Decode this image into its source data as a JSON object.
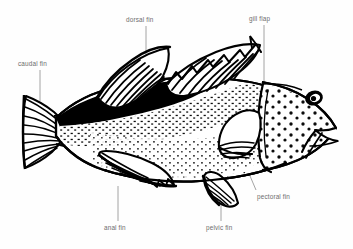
{
  "diagram": {
    "style": "black-and-white line drawing with stipple shading",
    "background_color": "#fefefe",
    "ink_color": "#000000",
    "leader_line_color": "#9a9a9a",
    "label_text_color": "#6d6d6d"
  },
  "labels": {
    "caudal_fin": "caudal fin",
    "dorsal_fin": "dorsal fin",
    "gill_flap": "gill flap",
    "pectoral_fin": "pectoral fin",
    "pelvic_fin": "pelvic fin",
    "anal_fin": "anal fin"
  },
  "callouts": [
    {
      "id": "caudal-fin",
      "label": "caudal fin",
      "label_x": 18,
      "label_y": 60,
      "leader_from_x": 40,
      "leader_from_y": 70,
      "leader_to_x": 40,
      "leader_to_y": 100
    },
    {
      "id": "dorsal-fin",
      "label": "dorsal fin",
      "label_x": 126,
      "label_y": 16,
      "leader_from_x": 146,
      "leader_from_y": 26,
      "leader_to_x": 146,
      "leader_to_y": 61
    },
    {
      "id": "gill-flap",
      "label": "gill flap",
      "label_x": 249,
      "label_y": 15,
      "leader_from_x": 264,
      "leader_from_y": 25,
      "leader_to_x": 264,
      "leader_to_y": 100
    },
    {
      "id": "pectoral-fin",
      "label": "pectoral fin",
      "label_x": 257,
      "label_y": 193,
      "leader_from_x": 256,
      "leader_from_y": 190,
      "leader_to_x": 232,
      "leader_to_y": 135
    },
    {
      "id": "pelvic-fin",
      "label": "pelvic fin",
      "label_x": 206,
      "label_y": 224,
      "leader_from_x": 221,
      "leader_from_y": 221,
      "leader_to_x": 221,
      "leader_to_y": 190
    },
    {
      "id": "anal-fin",
      "label": "anal fin",
      "label_x": 104,
      "label_y": 224,
      "leader_from_x": 118,
      "leader_from_y": 221,
      "leader_to_x": 118,
      "leader_to_y": 185
    }
  ],
  "parts": [
    {
      "id": "caudal-fin",
      "name": "caudal fin",
      "description": "fan-shaped tail fin with radiating ray lines"
    },
    {
      "id": "dorsal-fin",
      "name": "dorsal fin",
      "description": "long fin along the back, spiny front portion and soft-rayed rear portion"
    },
    {
      "id": "gill-flap",
      "name": "gill flap",
      "description": "operculum covering the gills behind the head"
    },
    {
      "id": "pectoral-fin",
      "name": "pectoral fin",
      "description": "rounded fan-shaped fin behind the gill flap"
    },
    {
      "id": "pelvic-fin",
      "name": "pelvic fin",
      "description": "paired fin on the underside below the pectoral fin"
    },
    {
      "id": "anal-fin",
      "name": "anal fin",
      "description": "fin on the underside between the pelvic fin and the tail"
    },
    {
      "id": "eye",
      "name": "eye",
      "description": "dark oval eye with light highlight"
    },
    {
      "id": "mouth",
      "name": "mouth",
      "description": "large jaw with thick lips at the front of the head"
    },
    {
      "id": "body",
      "name": "body",
      "description": "speckled flank with dark band along the upper back"
    }
  ]
}
